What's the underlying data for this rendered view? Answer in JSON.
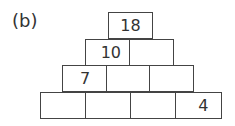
{
  "label": "(b)",
  "pyramid": {
    "rows": [
      [
        "18"
      ],
      [
        "10",
        ""
      ],
      [
        "7",
        "",
        ""
      ],
      [
        "",
        "",
        "",
        "4"
      ]
    ]
  }
}
